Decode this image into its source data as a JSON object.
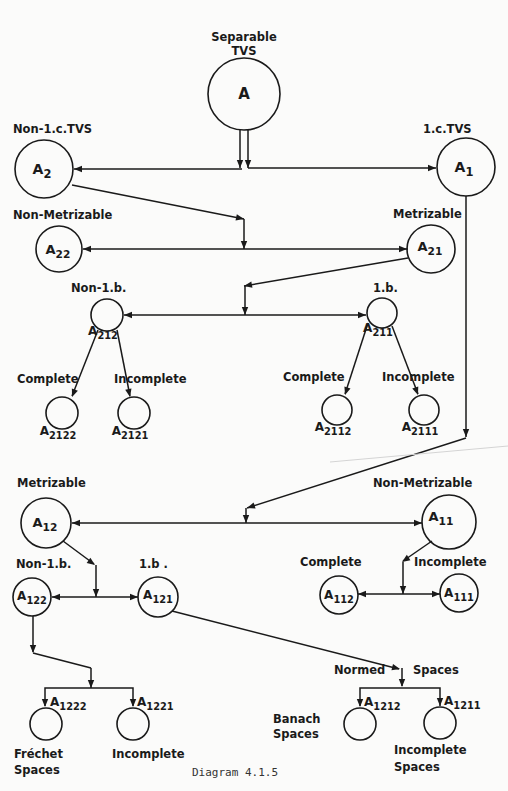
{
  "caption": "Diagram 4.1.5",
  "nodes": [
    {
      "id": "A",
      "base": "A",
      "sub": "",
      "category": "Separable TVS"
    },
    {
      "id": "A2",
      "base": "A",
      "sub": "2",
      "category": "Non-1.c.TVS"
    },
    {
      "id": "A1",
      "base": "A",
      "sub": "1",
      "category": "1.c.TVS"
    },
    {
      "id": "A22",
      "base": "A",
      "sub": "22",
      "category": "Non-Metrizable"
    },
    {
      "id": "A21",
      "base": "A",
      "sub": "21",
      "category": "Metrizable"
    },
    {
      "id": "A212",
      "base": "A",
      "sub": "212",
      "category": "Non-1.b."
    },
    {
      "id": "A211",
      "base": "A",
      "sub": "211",
      "category": "1.b."
    },
    {
      "id": "A2122",
      "base": "A",
      "sub": "2122",
      "category": "Complete"
    },
    {
      "id": "A2121",
      "base": "A",
      "sub": "2121",
      "category": "Incomplete"
    },
    {
      "id": "A2112",
      "base": "A",
      "sub": "2112",
      "category": "Complete"
    },
    {
      "id": "A2111",
      "base": "A",
      "sub": "2111",
      "category": "Incomplete"
    },
    {
      "id": "A12",
      "base": "A",
      "sub": "12",
      "category": "Metrizable"
    },
    {
      "id": "A11",
      "base": "A",
      "sub": "11",
      "category": "Non-Metrizable"
    },
    {
      "id": "A122",
      "base": "A",
      "sub": "122",
      "category": "Non-1.b."
    },
    {
      "id": "A121",
      "base": "A",
      "sub": "121",
      "category": "1.b ."
    },
    {
      "id": "A112",
      "base": "A",
      "sub": "112",
      "category": "Complete"
    },
    {
      "id": "A111",
      "base": "A",
      "sub": "111",
      "category": "Incomplete"
    },
    {
      "id": "A1222",
      "base": "A",
      "sub": "1222",
      "category": "Fréchet Spaces"
    },
    {
      "id": "A1221",
      "base": "A",
      "sub": "1221",
      "category": "Incomplete"
    },
    {
      "id": "A1212",
      "base": "A",
      "sub": "1212",
      "category": "Banach Spaces"
    },
    {
      "id": "A1211",
      "base": "A",
      "sub": "1211",
      "category": "Incomplete Spaces"
    }
  ],
  "labels": {
    "separable": "Separable",
    "tvs": "TVS",
    "non_lc_tvs": "Non-1.c.TVS",
    "lc_tvs": "1.c.TVS",
    "non_metrizable_top": "Non-Metrizable",
    "metrizable_top": "Metrizable",
    "non_lb_top": "Non-1.b.",
    "lb_top": "1.b.",
    "complete_1": "Complete",
    "incomplete_1": "Incomplete",
    "complete_2": "Complete",
    "incomplete_2": "Incomplete",
    "metrizable_bottom": "Metrizable",
    "non_metrizable_bottom": "Non-Metrizable",
    "non_lb_bottom": "Non-1.b.",
    "lb_bottom": "1.b .",
    "complete_3": "Complete",
    "incomplete_3": "Incomplete",
    "normed": "Normed",
    "spaces": "Spaces",
    "frechet": "Fréchet",
    "frechet_spaces": "Spaces",
    "incomplete_4": "Incomplete",
    "banach": "Banach",
    "banach_spaces": "Spaces",
    "incomplete_5": "Incomplete",
    "incomplete_5_spaces": "Spaces"
  },
  "edges": [
    {
      "from": "A",
      "to": "A2",
      "relation": "splits"
    },
    {
      "from": "A",
      "to": "A1",
      "relation": "splits"
    },
    {
      "from": "A2",
      "to": "A22",
      "relation": "splits"
    },
    {
      "from": "A2",
      "to": "A21",
      "relation": "splits"
    },
    {
      "from": "A21",
      "to": "A212",
      "relation": "splits"
    },
    {
      "from": "A21",
      "to": "A211",
      "relation": "splits"
    },
    {
      "from": "A212",
      "to": "A2122",
      "relation": "Complete"
    },
    {
      "from": "A212",
      "to": "A2121",
      "relation": "Incomplete"
    },
    {
      "from": "A211",
      "to": "A2112",
      "relation": "Complete"
    },
    {
      "from": "A211",
      "to": "A2111",
      "relation": "Incomplete"
    },
    {
      "from": "A1",
      "to": "A12",
      "relation": "splits"
    },
    {
      "from": "A1",
      "to": "A11",
      "relation": "splits"
    },
    {
      "from": "A12",
      "to": "A122",
      "relation": "splits"
    },
    {
      "from": "A12",
      "to": "A121",
      "relation": "splits"
    },
    {
      "from": "A11",
      "to": "A112",
      "relation": "splits"
    },
    {
      "from": "A11",
      "to": "A111",
      "relation": "splits"
    },
    {
      "from": "A122",
      "to": "A1222",
      "relation": "splits"
    },
    {
      "from": "A122",
      "to": "A1221",
      "relation": "splits"
    },
    {
      "from": "A121",
      "to": "A1212",
      "relation": "Normed Spaces"
    },
    {
      "from": "A121",
      "to": "A1211",
      "relation": "Normed Spaces"
    }
  ]
}
